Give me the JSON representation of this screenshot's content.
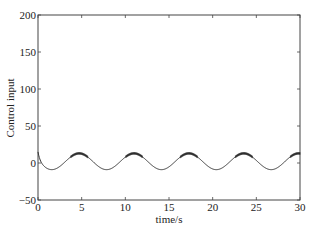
{
  "chart_data": {
    "type": "line",
    "title": "",
    "xlabel": "time/s",
    "ylabel": "Control input",
    "xlim": [
      0,
      30
    ],
    "ylim": [
      -50,
      200
    ],
    "xticks": [
      0,
      5,
      10,
      15,
      20,
      25,
      30
    ],
    "yticks": [
      -50,
      0,
      50,
      100,
      150,
      200
    ],
    "grid": false,
    "legend": null,
    "series": [
      {
        "name": "Control input",
        "color": "#333333",
        "description": "Approximately sinusoidal, u(t) ≈ 2 − 11·sin(t), initial value ≈ 15 at t=0, with slight chattering near peaks",
        "x": [
          0,
          0.5,
          1,
          1.57,
          2.5,
          3.5,
          4.71,
          6,
          7.0,
          7.85,
          9,
          10,
          11.0,
          12,
          13,
          14.14,
          15.5,
          16.5,
          17.28,
          18.5,
          19.5,
          20.42,
          21.5,
          22.5,
          23.56,
          24.5,
          25.5,
          26.7,
          28,
          29,
          29.85,
          30
        ],
        "values": [
          15,
          -3,
          -7,
          -9,
          -4,
          6,
          13,
          5,
          -5,
          -9,
          -2,
          8,
          12,
          6,
          -3,
          -9,
          -6,
          6,
          13,
          5,
          -4,
          -9,
          -2,
          8,
          13,
          7,
          -3,
          -9,
          3,
          11,
          13,
          12
        ]
      }
    ]
  }
}
